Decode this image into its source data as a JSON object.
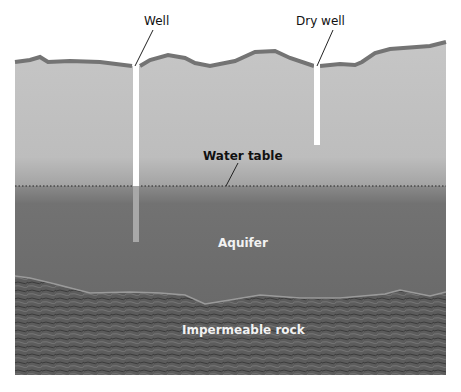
{
  "labels": {
    "well": "Well",
    "dry_well": "Dry well",
    "water_table": "Water table",
    "aquifer": "Aquifer",
    "impermeable_rock": "Impermeable rock"
  },
  "colors": {
    "unsaturated_zone": "#c4c4c4",
    "surface_crust": "#7a7a7a",
    "aquifer": "#6e6e6e",
    "rock": "#5a5a5a",
    "well_shaft": "#ffffff",
    "well_in_water": "#a8a8a8"
  }
}
